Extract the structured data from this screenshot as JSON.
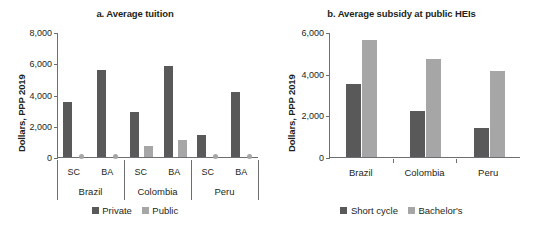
{
  "colors": {
    "private": "#595959",
    "public": "#a6a6a6",
    "short_cycle": "#595959",
    "bachelors": "#a6a6a6",
    "axis": "#6d6e71",
    "text": "#231f20",
    "background": "#ffffff"
  },
  "chart_data": [
    {
      "type": "bar",
      "title": "a. Average tuition",
      "xlabel": "",
      "ylabel": "Dollars, PPP 2019",
      "ylim": [
        0,
        8000
      ],
      "yticks": [
        0,
        2000,
        4000,
        6000,
        8000
      ],
      "ytick_labels": [
        "0",
        "2,000",
        "4,000",
        "6,000",
        "8,000"
      ],
      "grid": false,
      "legend_position": "bottom",
      "categories": [
        "SC",
        "BA",
        "SC",
        "BA",
        "SC",
        "BA"
      ],
      "groups": [
        {
          "label": "Brazil",
          "categories": [
            "SC",
            "BA"
          ]
        },
        {
          "label": "Colombia",
          "categories": [
            "SC",
            "BA"
          ]
        },
        {
          "label": "Peru",
          "categories": [
            "SC",
            "BA"
          ]
        }
      ],
      "series": [
        {
          "name": "Private",
          "values": [
            3500,
            5600,
            2900,
            5800,
            1400,
            4150
          ]
        },
        {
          "name": "Public",
          "values": [
            0,
            0,
            700,
            1100,
            0,
            0
          ]
        }
      ]
    },
    {
      "type": "bar",
      "title": "b. Average subsidy at public HEIs",
      "xlabel": "",
      "ylabel": "Dollars, PPP 2019",
      "ylim": [
        0,
        6000
      ],
      "yticks": [
        0,
        2000,
        4000,
        6000
      ],
      "ytick_labels": [
        "0",
        "2,000",
        "4,000",
        "6,000"
      ],
      "grid": false,
      "legend_position": "bottom",
      "categories": [
        "Brazil",
        "Colombia",
        "Peru"
      ],
      "series": [
        {
          "name": "Short cycle",
          "values": [
            3500,
            2200,
            1400
          ]
        },
        {
          "name": "Bachelor's",
          "values": [
            5600,
            4700,
            4150
          ]
        }
      ]
    }
  ],
  "panel_a": {
    "title": "a. Average tuition",
    "ylabel": "Dollars, PPP 2019",
    "ytick_labels": [
      "8,000",
      "6,000",
      "4,000",
      "2,000",
      "0"
    ],
    "cat_labels": [
      "SC",
      "BA",
      "SC",
      "BA",
      "SC",
      "BA"
    ],
    "group_labels": [
      "Brazil",
      "Colombia",
      "Peru"
    ],
    "legend": [
      {
        "label": "Private",
        "color": "#595959"
      },
      {
        "label": "Public",
        "color": "#a6a6a6"
      }
    ]
  },
  "panel_b": {
    "title": "b. Average subsidy at public HEIs",
    "ylabel": "Dollars, PPP 2019",
    "ytick_labels": [
      "6,000",
      "4,000",
      "2,000",
      "0"
    ],
    "cat_labels": [
      "Brazil",
      "Colombia",
      "Peru"
    ],
    "legend": [
      {
        "label": "Short cycle",
        "color": "#595959"
      },
      {
        "label": "Bachelor's",
        "color": "#a6a6a6"
      }
    ]
  }
}
